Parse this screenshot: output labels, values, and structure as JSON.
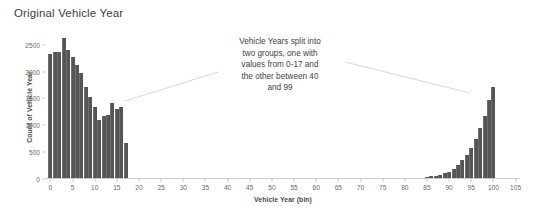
{
  "chart_data": {
    "type": "bar",
    "title": "Original Vehicle Year",
    "xlabel": "Vehicle Year (bin)",
    "ylabel": "Count of Vehicle Year",
    "xlim": [
      -1,
      106
    ],
    "ylim": [
      0,
      2700
    ],
    "grid": false,
    "legend": null,
    "bar_color": "#555555",
    "xticks": [
      0,
      5,
      10,
      15,
      20,
      25,
      30,
      35,
      40,
      45,
      50,
      55,
      60,
      65,
      70,
      75,
      80,
      85,
      90,
      95,
      100,
      105
    ],
    "yticks": [
      0,
      500,
      1000,
      1500,
      2000,
      2500
    ],
    "x": [
      0,
      1,
      2,
      3,
      4,
      5,
      6,
      7,
      8,
      9,
      10,
      11,
      12,
      13,
      14,
      15,
      16,
      17,
      85,
      86,
      87,
      88,
      89,
      90,
      91,
      92,
      93,
      94,
      95,
      96,
      97,
      98,
      99,
      100
    ],
    "values": [
      2310,
      2340,
      2350,
      2600,
      2380,
      2250,
      2110,
      1950,
      1690,
      1510,
      1330,
      1080,
      1160,
      1170,
      1400,
      1290,
      1330,
      660,
      20,
      30,
      45,
      60,
      85,
      120,
      175,
      240,
      330,
      430,
      560,
      720,
      930,
      1160,
      1450,
      1700
    ],
    "annotations": [
      {
        "text": "Vehicle Years split into two groups, one with values from 0-17 and the other between 40 and 99",
        "lines": [
          "Vehicle Years split into",
          "two groups, one with",
          "values from 0-17 and",
          "the other between 40",
          "and 99"
        ]
      }
    ]
  }
}
